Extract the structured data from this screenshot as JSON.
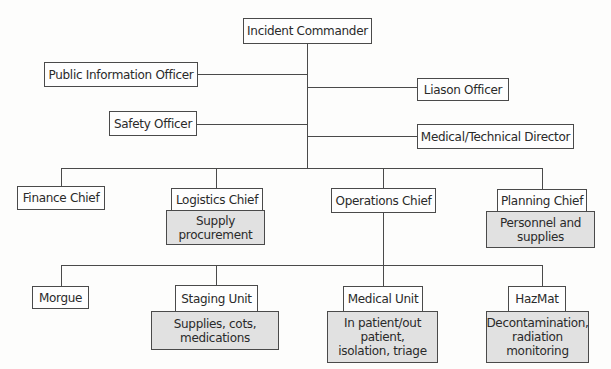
{
  "colors": {
    "line": "#4a4a4a",
    "box_fill": "#fefefe",
    "note_fill": "#e1e1e1"
  },
  "commander": {
    "label": "Incident Commander"
  },
  "staff": {
    "public_information": "Public Information Officer",
    "liaison": "Liason Officer",
    "safety": "Safety Officer",
    "medical_technical": "Medical/Technical Director"
  },
  "chiefs": {
    "finance": {
      "label": "Finance Chief"
    },
    "logistics": {
      "label": "Logistics Chief",
      "note": "Supply\nprocurement"
    },
    "operations": {
      "label": "Operations Chief"
    },
    "planning": {
      "label": "Planning Chief",
      "note": "Personnel and\nsupplies"
    }
  },
  "units": {
    "morgue": {
      "label": "Morgue"
    },
    "staging": {
      "label": "Staging Unit",
      "note": "Supplies, cots,\nmedications"
    },
    "medical": {
      "label": "Medical Unit",
      "note": "In patient/out\npatient,\nisolation, triage"
    },
    "hazmat": {
      "label": "HazMat",
      "note": "Decontamination,\nradiation\nmonitoring"
    }
  }
}
